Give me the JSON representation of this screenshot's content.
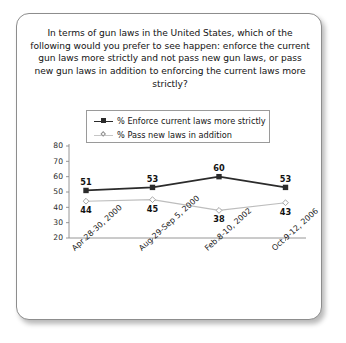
{
  "card": {
    "question": "In terms of gun laws in the United States, which of the following would you prefer to see happen: enforce the current gun laws more strictly and not pass new gun laws, or pass new gun laws in addition to enforcing the current laws more strictly?"
  },
  "legend": {
    "position": "top-center",
    "entries": [
      {
        "label": "% Enforce current laws more strictly",
        "marker": "filled-square",
        "color": "#2b2b2b"
      },
      {
        "label": "% Pass new laws in addition",
        "marker": "open-diamond",
        "color": "#b9b9b9"
      }
    ]
  },
  "chart_data": {
    "type": "line",
    "title": "In terms of gun laws in the United States, which of the following would you prefer to see happen: enforce the current gun laws more strictly and not pass new gun laws, or pass new gun laws in addition to enforcing the current laws more strictly?",
    "xlabel": "",
    "ylabel": "",
    "categories": [
      "Apr 28-30, 2000",
      "Aug 29-Sep 5, 2000",
      "Feb 8-10, 2002",
      "Oct 9-12, 2006"
    ],
    "series": [
      {
        "name": "% Enforce current laws more strictly",
        "values": [
          51,
          53,
          60,
          53
        ],
        "color": "#2b2b2b",
        "marker": "filled-square"
      },
      {
        "name": "% Pass new laws in addition",
        "values": [
          44,
          45,
          38,
          43
        ],
        "color": "#bdbdbd",
        "marker": "open-diamond"
      }
    ],
    "ylim": [
      20,
      80
    ],
    "yticks": [
      20,
      30,
      40,
      50,
      60,
      70,
      80
    ],
    "grid": false,
    "legend_position": "top-center"
  }
}
